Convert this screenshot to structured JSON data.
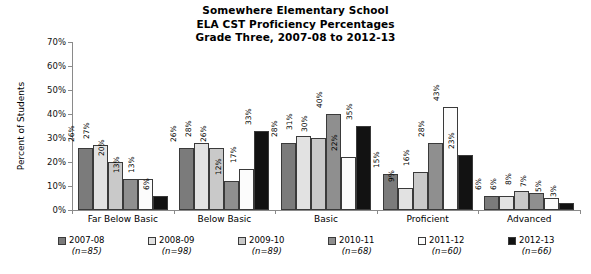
{
  "chart_data": {
    "type": "bar",
    "title": "Somewhere Elementary School ELA CST Proficiency Percentages Grade Three, 2007-08 to 2012-13",
    "title_lines": [
      "Somewhere Elementary School",
      "ELA CST Proficiency Percentages",
      "Grade Three, 2007-08 to 2012-13"
    ],
    "xlabel": "",
    "ylabel": "Percent of Students",
    "ylim": [
      0,
      70
    ],
    "ytick_labels": [
      "70%",
      "60%",
      "50%",
      "40%",
      "30%",
      "20%",
      "10%",
      "0%"
    ],
    "ytick_values": [
      70,
      60,
      50,
      40,
      30,
      20,
      10,
      0
    ],
    "grid": false,
    "legend_position": "bottom",
    "categories": [
      "Far Below Basic",
      "Below Basic",
      "Basic",
      "Proficient",
      "Advanced"
    ],
    "series": [
      {
        "name": "2007-08",
        "n_label": "(n=85)",
        "n": 85,
        "color": "#7b7b7b",
        "values": [
          26,
          26,
          28,
          15,
          6
        ],
        "labels": [
          "26%",
          "26%",
          "28%",
          "15%",
          "6%"
        ]
      },
      {
        "name": "2008-09",
        "n_label": "(n=98)",
        "n": 98,
        "color": "#e2e2e2",
        "values": [
          27,
          28,
          31,
          9,
          6
        ],
        "labels": [
          "27%",
          "28%",
          "31%",
          "9%",
          "6%"
        ]
      },
      {
        "name": "2009-10",
        "n_label": "(n=89)",
        "n": 89,
        "color": "#c9c9c9",
        "values": [
          20,
          26,
          30,
          16,
          8
        ],
        "labels": [
          "20%",
          "26%",
          "30%",
          "16%",
          "8%"
        ]
      },
      {
        "name": "2010-11",
        "n_label": "(n=68)",
        "n": 68,
        "color": "#8f8f8f",
        "values": [
          13,
          12,
          40,
          28,
          7
        ],
        "labels": [
          "13%",
          "12%",
          "40%",
          "28%",
          "7%"
        ]
      },
      {
        "name": "2011-12",
        "n_label": "(n=60)",
        "n": 60,
        "color": "#fcfcfc",
        "values": [
          13,
          17,
          22,
          43,
          5
        ],
        "labels": [
          "13%",
          "17%",
          "22%",
          "43%",
          "5%"
        ]
      },
      {
        "name": "2012-13",
        "n_label": "(n=66)",
        "n": 66,
        "color": "#121212",
        "values": [
          6,
          33,
          35,
          23,
          3
        ],
        "labels": [
          "6%",
          "33%",
          "35%",
          "23%",
          "3%"
        ]
      }
    ]
  }
}
